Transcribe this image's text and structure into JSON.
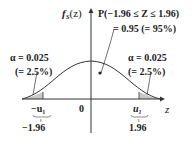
{
  "figure": {
    "y_axis_label_main": "f",
    "y_axis_label_sub": "S",
    "y_axis_label_arg": "(z)",
    "x_axis_label": "z",
    "probability_line1": "P(−1.96 ≤ Z ≤ 1.96)",
    "probability_line2": "= 0.95 (= 95%)",
    "left_tail": {
      "alpha": "α = 0.025",
      "percent": "(= 2.5%)"
    },
    "right_tail": {
      "alpha": "α = 0.025",
      "percent": "(= 2.5%)"
    },
    "origin_label": "0",
    "left_critical": {
      "symbol": "−u",
      "sub": "1",
      "eq": "‖",
      "value": "−1.96"
    },
    "right_critical": {
      "symbol": "u",
      "sub": "1",
      "eq": "‖",
      "value": "1.96"
    }
  },
  "colors": {
    "line": "#333333",
    "shade": "#c8c8c8",
    "text": "#222222"
  }
}
